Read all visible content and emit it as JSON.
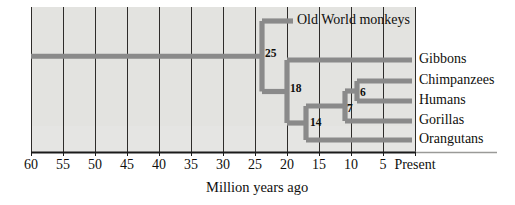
{
  "figure": {
    "kind": "phylogenetic-tree",
    "axis_title": "Million years ago",
    "panel_color": "#e3e3e0",
    "branch_color": "#8a8a8a",
    "gridline_color": "#2e2c2a",
    "axis_color": "#1a1a1a",
    "text_color": "#100f0d"
  },
  "axis": {
    "unit": "Million years ago",
    "present_label": "Present",
    "ticks": [
      {
        "value": 60,
        "label": "60",
        "x": 31
      },
      {
        "value": 55,
        "label": "55",
        "x": 63
      },
      {
        "value": 50,
        "label": "50",
        "x": 95
      },
      {
        "value": 45,
        "label": "45",
        "x": 127
      },
      {
        "value": 40,
        "label": "40",
        "x": 159
      },
      {
        "value": 35,
        "label": "35",
        "x": 191
      },
      {
        "value": 30,
        "label": "30",
        "x": 223
      },
      {
        "value": 25,
        "label": "25",
        "x": 255
      },
      {
        "value": 20,
        "label": "20",
        "x": 287
      },
      {
        "value": 15,
        "label": "15",
        "x": 319
      },
      {
        "value": 10,
        "label": "10",
        "x": 351
      },
      {
        "value": 5,
        "label": "5",
        "x": 383
      },
      {
        "value": 0,
        "label": "Present",
        "x": 415
      }
    ]
  },
  "taxa": [
    {
      "name": "Old World monkeys",
      "y": 21,
      "tip_x": 293,
      "label_x": 297
    },
    {
      "name": "Gibbons",
      "y": 60,
      "tip_x": 412,
      "label_x": 419
    },
    {
      "name": "Chimpanzees",
      "y": 81,
      "tip_x": 412,
      "label_x": 419
    },
    {
      "name": "Humans",
      "y": 101,
      "tip_x": 412,
      "label_x": 419
    },
    {
      "name": "Gorillas",
      "y": 121,
      "tip_x": 412,
      "label_x": 419
    },
    {
      "name": "Orangutans",
      "y": 140,
      "tip_x": 412,
      "label_x": 419
    }
  ],
  "nodes": [
    {
      "label": "25",
      "mya": 25,
      "x": 262,
      "text_x": 265,
      "text_y": 48
    },
    {
      "label": "18",
      "mya": 18,
      "x": 287,
      "text_x": 290,
      "text_y": 83
    },
    {
      "label": "14",
      "mya": 14,
      "x": 306,
      "text_x": 310,
      "text_y": 117
    },
    {
      "label": "7",
      "mya": 7,
      "x": 345,
      "text_x": 347,
      "text_y": 103
    },
    {
      "label": "6",
      "mya": 6,
      "x": 357,
      "text_x": 360,
      "text_y": 87
    }
  ],
  "chart_data": {
    "type": "tree",
    "title": "",
    "xlabel": "Million years ago",
    "ylabel": "",
    "xlim": [
      60,
      0
    ],
    "x_tick_labels": [
      "60",
      "55",
      "50",
      "45",
      "40",
      "35",
      "30",
      "25",
      "20",
      "15",
      "10",
      "5",
      "Present"
    ],
    "grid": true,
    "legend": "none",
    "leaves": [
      "Old World monkeys",
      "Gibbons",
      "Chimpanzees",
      "Humans",
      "Gorillas",
      "Orangutans"
    ],
    "internal_nodes": [
      {
        "label": "25",
        "divergence_mya": 25,
        "children": [
          "Old World monkeys",
          "18"
        ]
      },
      {
        "label": "18",
        "divergence_mya": 18,
        "children": [
          "Gibbons",
          "14"
        ]
      },
      {
        "label": "14",
        "divergence_mya": 14,
        "children": [
          "7",
          "Orangutans"
        ]
      },
      {
        "label": "7",
        "divergence_mya": 7,
        "children": [
          "6",
          "Gorillas"
        ]
      },
      {
        "label": "6",
        "divergence_mya": 6,
        "children": [
          "Chimpanzees",
          "Humans"
        ]
      }
    ],
    "root_mya": 60,
    "annotations": [
      "25",
      "18",
      "14",
      "7",
      "6"
    ]
  }
}
